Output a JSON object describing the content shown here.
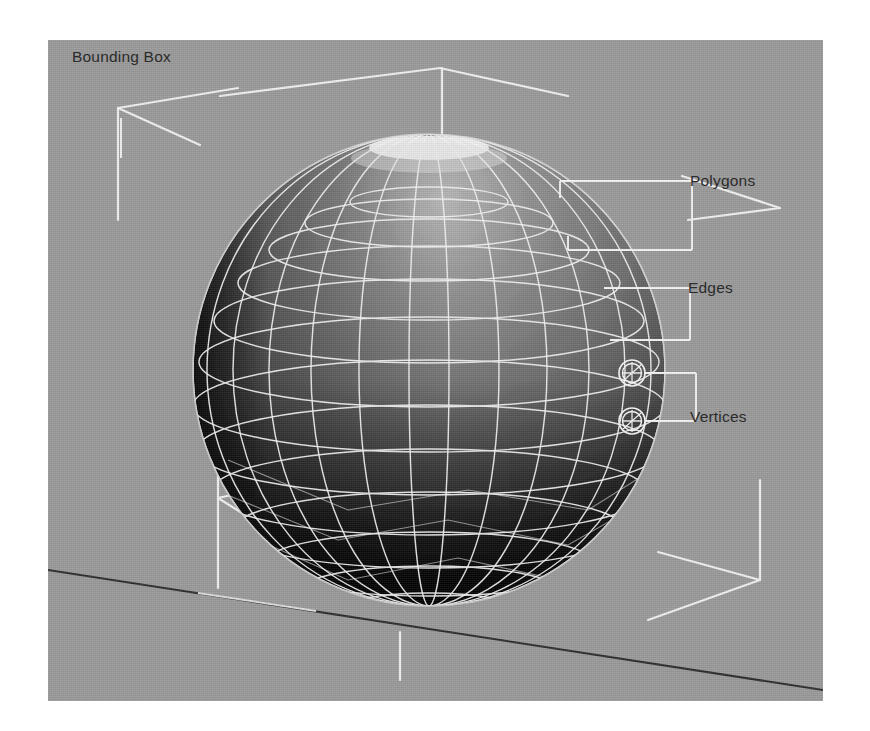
{
  "scene": {
    "title": "3D polygon mesh sphere with component callouts",
    "canvas": {
      "x": 48,
      "y": 40,
      "width": 775,
      "height": 661
    },
    "background_color": "#9a9a9a",
    "line_color": "#f2f2f2",
    "axis_color": "#232323",
    "text_color": "#2b2b2b"
  },
  "annotations": [
    {
      "id": "bounding_box",
      "label": "Bounding Box",
      "leader": "vertical-tick"
    },
    {
      "id": "polygons",
      "label": "Polygons",
      "leader": "bracket-two-arm"
    },
    {
      "id": "edges",
      "label": "Edges",
      "leader": "bracket-two-arm"
    },
    {
      "id": "vertices",
      "label": "Vertices",
      "leader": "bracket-two-arm-circles"
    }
  ],
  "object": {
    "type": "sphere",
    "shading": "flat-faceted",
    "wireframe": true,
    "center": {
      "x": 381,
      "y": 330
    },
    "radius": 236,
    "longitude_segments": 24,
    "latitude_segments": 16,
    "light_direction": "top",
    "surface_light": "#8e8e8e",
    "surface_dark": "#0a0a0a"
  },
  "bounding_box": {
    "visible": true,
    "style": "corner-brackets",
    "corner_count": 4,
    "corners": [
      "top-left",
      "top-right",
      "bottom-left",
      "bottom-right"
    ]
  },
  "vertex_markers": {
    "count": 2,
    "style": "double-ring-crosshair",
    "positions": [
      {
        "x": 584,
        "y": 333
      },
      {
        "x": 584,
        "y": 381
      }
    ]
  },
  "axes": {
    "ground_axis_visible": true,
    "ground_axis_color": "#232323",
    "tick_marks": [
      "top-center",
      "bottom-center"
    ]
  }
}
